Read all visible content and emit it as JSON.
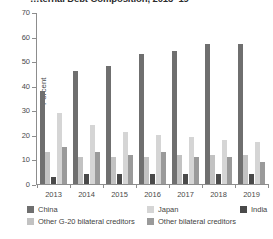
{
  "title": "…ternal Debt Composition, 2013–19",
  "axis": {
    "ylabel": "Percent",
    "yticks": [
      "0",
      "10",
      "20",
      "30",
      "40",
      "50",
      "60",
      "70"
    ]
  },
  "legend": {
    "items": [
      {
        "key": "china",
        "label": "China",
        "color": "#6f6f6f"
      },
      {
        "key": "japan",
        "label": "Japan",
        "color": "#d5d5d5"
      },
      {
        "key": "india",
        "label": "India",
        "color": "#4a4a4a"
      },
      {
        "key": "og20",
        "label": "Other G-20 bilateral creditors",
        "color": "#c2c2c2"
      },
      {
        "key": "obc",
        "label": "Other bilateral creditors",
        "color": "#9a9a9a"
      }
    ]
  },
  "chart_data": {
    "type": "bar",
    "title": "…ternal Debt Composition, 2013–19",
    "xlabel": "",
    "ylabel": "Percent",
    "ylim": [
      0,
      70
    ],
    "ytick_step": 10,
    "grid": false,
    "legend_position": "bottom",
    "categories": [
      "2013",
      "2014",
      "2015",
      "2016",
      "2017",
      "2018",
      "2019"
    ],
    "series": [
      {
        "name": "China",
        "color": "#6f6f6f",
        "values": [
          38,
          46,
          48,
          53,
          54,
          57,
          57
        ]
      },
      {
        "name": "Other G-20 bilateral creditors",
        "color": "#c2c2c2",
        "values": [
          13,
          11,
          11,
          11,
          12,
          12,
          12
        ]
      },
      {
        "name": "India",
        "color": "#4a4a4a",
        "values": [
          3,
          4,
          4,
          4,
          4,
          4,
          4
        ]
      },
      {
        "name": "Japan",
        "color": "#d5d5d5",
        "values": [
          29,
          24,
          21,
          20,
          19,
          18,
          17
        ]
      },
      {
        "name": "Other bilateral creditors",
        "color": "#9a9a9a",
        "values": [
          15,
          13,
          12,
          13,
          11,
          11,
          9
        ]
      }
    ]
  }
}
